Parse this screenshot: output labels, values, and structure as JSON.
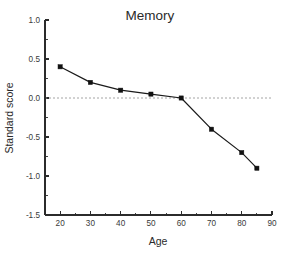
{
  "chart_data": {
    "type": "line",
    "title": "Memory",
    "xlabel": "Age",
    "ylabel": "Standard score",
    "x": [
      20,
      30,
      40,
      50,
      60,
      70,
      80,
      85
    ],
    "values": [
      0.4,
      0.2,
      0.1,
      0.05,
      0.0,
      -0.4,
      -0.7,
      -0.9
    ],
    "series": [
      {
        "name": "Memory",
        "values": [
          0.4,
          0.2,
          0.1,
          0.05,
          0.0,
          -0.4,
          -0.7,
          -0.9
        ]
      }
    ],
    "xlim": [
      15,
      90
    ],
    "ylim": [
      -1.5,
      1.0
    ],
    "xticks": [
      20,
      30,
      40,
      50,
      60,
      70,
      80,
      90
    ],
    "xtick_labels": [
      "20",
      "30",
      "40",
      "50",
      "60",
      "70",
      "80",
      "90"
    ],
    "xminor_ticks": [
      15,
      25,
      35,
      45,
      55,
      65,
      75,
      85
    ],
    "yticks": [
      1.0,
      0.5,
      0.0,
      -0.5,
      -1.0,
      -1.5
    ],
    "ytick_labels": [
      "1.0",
      "0.5",
      "0.0",
      "-0.5",
      "-1.0",
      "-1.5"
    ],
    "yminor_ticks": [
      0.75,
      0.25,
      -0.25,
      -0.75,
      -1.25
    ],
    "grid": false,
    "legend": "none",
    "reference_lines": [
      {
        "name": "zero-line",
        "axis": "y",
        "value": 0.0,
        "style": "dashed",
        "color": "#9a9a9a"
      }
    ],
    "marker": "square",
    "line_color": "#1a1a1a",
    "marker_color": "#111111",
    "background_color": "#ffffff"
  }
}
